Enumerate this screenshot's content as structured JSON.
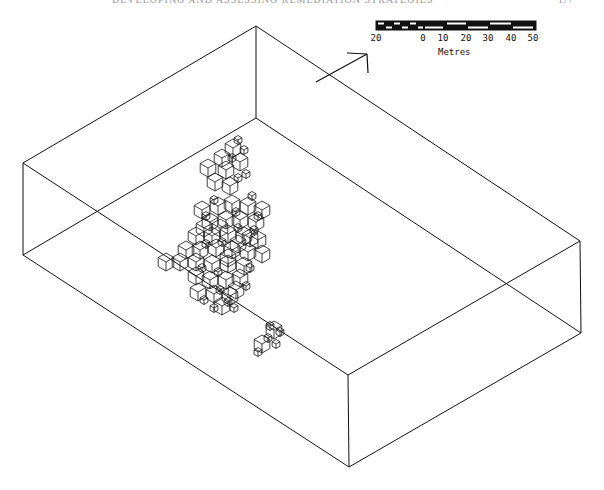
{
  "page": {
    "header": "DEVELOPING AND ASSESSING REMEDIATION STRATEGIES",
    "page_number": "177"
  },
  "colors": {
    "line": "#111111",
    "background": "#ffffff"
  },
  "scale_bar": {
    "title": "Metres",
    "ticks": [
      {
        "label": "20",
        "x": 376
      },
      {
        "label": "0",
        "x": 423
      },
      {
        "label": "10",
        "x": 443
      },
      {
        "label": "20",
        "x": 466
      },
      {
        "label": "30",
        "x": 488
      },
      {
        "label": "40",
        "x": 511
      },
      {
        "label": "50",
        "x": 533
      }
    ]
  },
  "north_arrow": {
    "icon": "north-arrow-icon"
  },
  "box": {
    "top_face": [
      [
        23,
        163
      ],
      [
        256,
        26
      ],
      [
        580,
        241
      ],
      [
        348,
        375
      ]
    ],
    "bottom_face": [
      [
        23,
        255
      ],
      [
        256,
        118
      ],
      [
        581,
        333
      ],
      [
        349,
        467
      ]
    ]
  },
  "blocks": {
    "size": 9,
    "positions": [
      [
        233,
        148
      ],
      [
        222,
        158
      ],
      [
        208,
        168
      ],
      [
        226,
        170
      ],
      [
        240,
        162
      ],
      [
        215,
        182
      ],
      [
        230,
        186
      ],
      [
        202,
        210
      ],
      [
        218,
        206
      ],
      [
        232,
        204
      ],
      [
        248,
        206
      ],
      [
        262,
        210
      ],
      [
        210,
        222
      ],
      [
        226,
        220
      ],
      [
        240,
        220
      ],
      [
        256,
        222
      ],
      [
        196,
        236
      ],
      [
        212,
        236
      ],
      [
        228,
        234
      ],
      [
        244,
        236
      ],
      [
        258,
        240
      ],
      [
        186,
        250
      ],
      [
        200,
        250
      ],
      [
        216,
        248
      ],
      [
        232,
        250
      ],
      [
        248,
        252
      ],
      [
        262,
        254
      ],
      [
        166,
        262
      ],
      [
        180,
        262
      ],
      [
        196,
        262
      ],
      [
        212,
        264
      ],
      [
        228,
        264
      ],
      [
        244,
        266
      ],
      [
        196,
        276
      ],
      [
        210,
        280
      ],
      [
        226,
        280
      ],
      [
        240,
        278
      ],
      [
        198,
        292
      ],
      [
        214,
        294
      ],
      [
        230,
        296
      ],
      [
        222,
        306
      ],
      [
        274,
        330
      ],
      [
        262,
        344
      ],
      [
        228,
        258
      ],
      [
        238,
        244
      ],
      [
        220,
        228
      ],
      [
        204,
        228
      ],
      [
        250,
        238
      ],
      [
        236,
        290
      ]
    ],
    "small_positions": [
      [
        238,
        140
      ],
      [
        244,
        150
      ],
      [
        232,
        158
      ],
      [
        246,
        174
      ],
      [
        238,
        178
      ],
      [
        252,
        196
      ],
      [
        258,
        216
      ],
      [
        214,
        200
      ],
      [
        206,
        216
      ],
      [
        236,
        212
      ],
      [
        222,
        242
      ],
      [
        238,
        228
      ],
      [
        254,
        230
      ],
      [
        206,
        244
      ],
      [
        250,
        268
      ],
      [
        218,
        272
      ],
      [
        204,
        300
      ],
      [
        228,
        302
      ],
      [
        214,
        308
      ],
      [
        234,
        308
      ],
      [
        270,
        326
      ],
      [
        280,
        332
      ],
      [
        268,
        338
      ],
      [
        276,
        344
      ],
      [
        258,
        352
      ],
      [
        220,
        290
      ],
      [
        246,
        286
      ],
      [
        202,
        268
      ]
    ]
  }
}
